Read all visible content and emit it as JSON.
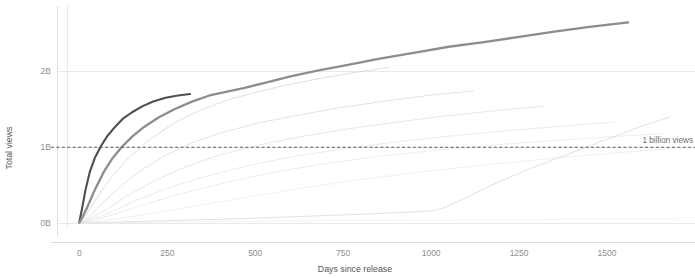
{
  "chart_data": {
    "type": "line",
    "title": "",
    "xlabel": "Days since release",
    "ylabel": "Total views",
    "xlim": [
      -35,
      1730
    ],
    "ylim": [
      -0.06,
      2.75
    ],
    "grid": true,
    "legend": "none",
    "x_ticks": [
      0,
      250,
      500,
      750,
      1000,
      1250,
      1500
    ],
    "x_tick_labels": [
      "0",
      "250",
      "500",
      "750",
      "1000",
      "1250",
      "1500"
    ],
    "y_ticks": [
      0,
      1,
      2
    ],
    "y_tick_labels": [
      "0B",
      "1B",
      "2B"
    ],
    "annotations": [
      {
        "name": "one-billion-threshold",
        "label": "1 billion views",
        "y_value": 1.0,
        "style": "dashed-horizontal-line"
      }
    ],
    "series": [
      {
        "name": "highlighted-video-dark",
        "emphasis": "high",
        "color": "#4f4f4f",
        "width": 2.1,
        "opacity": 1,
        "x": [
          0,
          8,
          18,
          30,
          45,
          62,
          80,
          100,
          125,
          150,
          180,
          210,
          245,
          280,
          315
        ],
        "y": [
          0.02,
          0.2,
          0.45,
          0.68,
          0.87,
          1.02,
          1.15,
          1.26,
          1.38,
          1.46,
          1.54,
          1.6,
          1.65,
          1.68,
          1.7
        ]
      },
      {
        "name": "highlighted-video-gray",
        "emphasis": "high",
        "color": "#8d8d8d",
        "width": 2.3,
        "opacity": 1,
        "x": [
          0,
          10,
          25,
          45,
          70,
          95,
          120,
          150,
          185,
          225,
          270,
          320,
          370,
          420,
          470,
          530,
          600,
          680,
          760,
          850,
          950,
          1050,
          1150,
          1250,
          1350,
          1450,
          1560
        ],
        "y": [
          0.01,
          0.09,
          0.24,
          0.45,
          0.68,
          0.86,
          1.0,
          1.14,
          1.27,
          1.39,
          1.5,
          1.6,
          1.68,
          1.73,
          1.78,
          1.85,
          1.93,
          2.01,
          2.08,
          2.16,
          2.24,
          2.32,
          2.38,
          2.45,
          2.52,
          2.58,
          2.64
        ]
      },
      {
        "name": "background-video-1",
        "emphasis": "low",
        "color": "#cfcfcf",
        "width": 0.8,
        "opacity": 0.85,
        "x": [
          0,
          20,
          50,
          90,
          140,
          200,
          270,
          340,
          420,
          500,
          590,
          680,
          780,
          880
        ],
        "y": [
          0.0,
          0.12,
          0.34,
          0.6,
          0.86,
          1.1,
          1.32,
          1.48,
          1.62,
          1.72,
          1.82,
          1.9,
          1.98,
          2.05
        ]
      },
      {
        "name": "background-video-2",
        "emphasis": "low",
        "color": "#d6d6d6",
        "width": 0.8,
        "opacity": 0.85,
        "x": [
          0,
          25,
          60,
          110,
          170,
          240,
          320,
          410,
          510,
          620,
          740,
          860,
          990,
          1120
        ],
        "y": [
          0.0,
          0.08,
          0.24,
          0.46,
          0.68,
          0.88,
          1.06,
          1.2,
          1.32,
          1.42,
          1.52,
          1.6,
          1.68,
          1.74
        ]
      },
      {
        "name": "background-video-3",
        "emphasis": "low",
        "color": "#dcdcdc",
        "width": 0.8,
        "opacity": 0.85,
        "x": [
          0,
          30,
          75,
          135,
          210,
          300,
          400,
          510,
          630,
          760,
          900,
          1040,
          1180,
          1320
        ],
        "y": [
          0.0,
          0.06,
          0.18,
          0.36,
          0.55,
          0.74,
          0.9,
          1.03,
          1.14,
          1.24,
          1.33,
          1.41,
          1.48,
          1.54
        ]
      },
      {
        "name": "background-video-4",
        "emphasis": "low",
        "color": "#e0e0e0",
        "width": 0.8,
        "opacity": 0.85,
        "x": [
          0,
          35,
          90,
          160,
          250,
          360,
          480,
          610,
          750,
          900,
          1060,
          1220,
          1380,
          1520
        ],
        "y": [
          0.0,
          0.05,
          0.15,
          0.3,
          0.46,
          0.62,
          0.76,
          0.88,
          0.98,
          1.07,
          1.15,
          1.22,
          1.28,
          1.33
        ]
      },
      {
        "name": "background-video-5",
        "emphasis": "low",
        "color": "#e4e4e4",
        "width": 0.8,
        "opacity": 0.85,
        "x": [
          0,
          40,
          100,
          180,
          280,
          400,
          540,
          690,
          850,
          1010,
          1180,
          1350,
          1520,
          1660
        ],
        "y": [
          0.0,
          0.04,
          0.12,
          0.24,
          0.38,
          0.52,
          0.66,
          0.78,
          0.88,
          0.96,
          1.03,
          1.09,
          1.14,
          1.18
        ]
      },
      {
        "name": "background-video-6",
        "emphasis": "low",
        "color": "#e6e6e6",
        "width": 0.8,
        "opacity": 0.8,
        "x": [
          0,
          60,
          150,
          280,
          430,
          600,
          790,
          980,
          1180,
          1380,
          1560,
          1700
        ],
        "y": [
          0.0,
          0.03,
          0.09,
          0.19,
          0.31,
          0.44,
          0.57,
          0.68,
          0.78,
          0.87,
          0.94,
          0.99
        ]
      },
      {
        "name": "background-video-slow-riser",
        "emphasis": "low",
        "color": "#dadada",
        "width": 0.9,
        "opacity": 0.9,
        "x": [
          0,
          120,
          280,
          450,
          620,
          800,
          950,
          1010,
          1040,
          1100,
          1180,
          1270,
          1360,
          1440,
          1520,
          1600,
          1680
        ],
        "y": [
          0.0,
          0.02,
          0.04,
          0.06,
          0.09,
          0.12,
          0.15,
          0.17,
          0.21,
          0.34,
          0.52,
          0.7,
          0.86,
          1.0,
          1.14,
          1.28,
          1.4
        ]
      },
      {
        "name": "background-video-flat-low",
        "emphasis": "low",
        "color": "#ececec",
        "width": 0.8,
        "opacity": 0.85,
        "x": [
          0,
          150,
          350,
          550,
          780,
          1000,
          1250,
          1500,
          1700
        ],
        "y": [
          0.0,
          0.012,
          0.022,
          0.03,
          0.038,
          0.045,
          0.052,
          0.058,
          0.062
        ]
      }
    ]
  }
}
